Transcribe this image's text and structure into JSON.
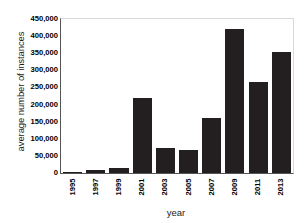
{
  "chart_data": {
    "type": "bar",
    "title": "",
    "xlabel": "year",
    "ylabel": "average number of instances",
    "categories": [
      "1995",
      "1997",
      "1999",
      "2001",
      "2003",
      "2005",
      "2007",
      "2009",
      "2011",
      "2013"
    ],
    "values": [
      2000,
      8000,
      14000,
      220000,
      73000,
      67000,
      160000,
      420000,
      265000,
      355000
    ],
    "ylim": [
      0,
      450000
    ],
    "ytick_values": [
      0,
      50000,
      100000,
      150000,
      200000,
      250000,
      300000,
      350000,
      400000,
      450000
    ],
    "ytick_labels": [
      "0",
      "50,000",
      "100,000",
      "150,000",
      "200,000",
      "250,000",
      "300,000",
      "350,000",
      "400,000",
      "450,000"
    ],
    "xtick_labels": [
      "1995",
      "1997",
      "1999",
      "2001",
      "2003",
      "2005",
      "2007",
      "2009",
      "2011",
      "2013"
    ],
    "grid": false,
    "legend": null,
    "bar_color": "#231f20",
    "background_color": "#ffffff",
    "axis_color": "#555555"
  }
}
